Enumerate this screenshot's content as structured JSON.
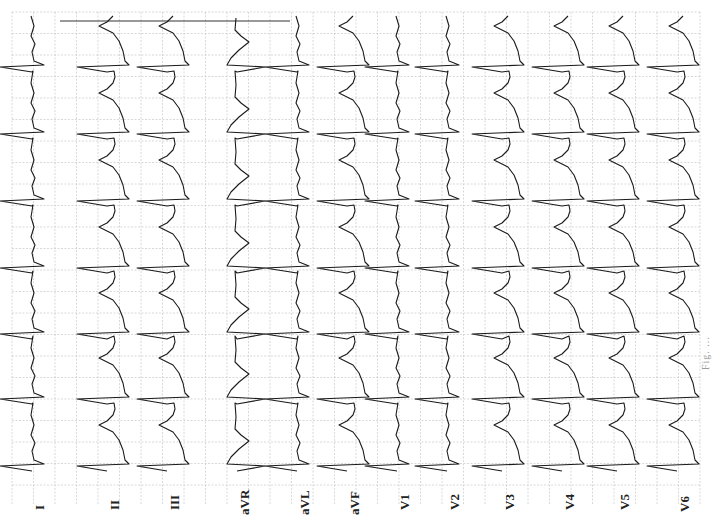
{
  "figure": {
    "kind": "12-lead electrocardiogram (rotated 90°)",
    "caption": "Fig. ...",
    "paper": {
      "background": "#ffffff",
      "grid_color": "#c8c8c8",
      "trace_color": "#1a1a1a"
    }
  },
  "leads": [
    {
      "label": "I",
      "x": 30,
      "label_y": 510,
      "morph": "small"
    },
    {
      "label": "II",
      "x": 105,
      "label_y": 510,
      "morph": "st_elev"
    },
    {
      "label": "III",
      "x": 165,
      "label_y": 510,
      "morph": "st_elev"
    },
    {
      "label": "aVR",
      "x": 235,
      "label_y": 515,
      "morph": "small_inv"
    },
    {
      "label": "aVL",
      "x": 295,
      "label_y": 515,
      "morph": "small"
    },
    {
      "label": "aVF",
      "x": 345,
      "label_y": 515,
      "morph": "st_elev"
    },
    {
      "label": "V1",
      "x": 395,
      "label_y": 510,
      "morph": "small"
    },
    {
      "label": "V2",
      "x": 445,
      "label_y": 510,
      "morph": "small"
    },
    {
      "label": "V3",
      "x": 500,
      "label_y": 510,
      "morph": "st_elev"
    },
    {
      "label": "V4",
      "x": 560,
      "label_y": 510,
      "morph": "st_elev"
    },
    {
      "label": "V5",
      "x": 615,
      "label_y": 510,
      "morph": "st_elev"
    },
    {
      "label": "V6",
      "x": 675,
      "label_y": 512,
      "morph": "st_elev"
    }
  ],
  "beats_y": [
    465,
    398,
    333,
    267,
    200,
    133,
    66,
    8
  ]
}
